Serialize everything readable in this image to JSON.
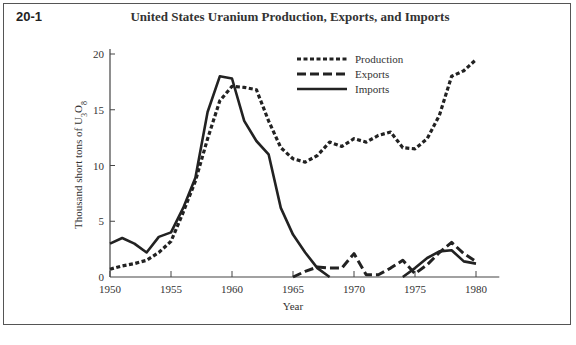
{
  "figure": {
    "number": "20-1",
    "title": "United States Uranium Production, Exports, and Imports"
  },
  "chart_data": {
    "type": "line",
    "title": "United States Uranium Production, Exports, and Imports",
    "xlabel": "Year",
    "ylabel": "Thousand short tons of U3O8",
    "xlim": [
      1950,
      1981.5
    ],
    "ylim": [
      0,
      20
    ],
    "x_ticks": [
      1950,
      1955,
      1960,
      1965,
      1970,
      1975,
      1980
    ],
    "y_ticks": [
      0,
      5,
      10,
      15,
      20
    ],
    "grid": false,
    "legend_position": "upper-right",
    "series": [
      {
        "name": "Production",
        "style": "dotted",
        "x": [
          1950,
          1951,
          1952,
          1953,
          1954,
          1955,
          1956,
          1957,
          1958,
          1959,
          1960,
          1961,
          1962,
          1963,
          1964,
          1965,
          1966,
          1967,
          1968,
          1969,
          1970,
          1971,
          1972,
          1973,
          1974,
          1975,
          1976,
          1977,
          1978,
          1979,
          1980
        ],
        "values": [
          0.7,
          1.0,
          1.2,
          1.5,
          2.2,
          3.2,
          5.8,
          8.6,
          12.4,
          15.8,
          17.1,
          17.0,
          16.8,
          14.0,
          11.6,
          10.6,
          10.3,
          10.9,
          12.1,
          11.7,
          12.4,
          12.1,
          12.7,
          13.0,
          11.6,
          11.5,
          12.4,
          14.5,
          18.0,
          18.5,
          19.5
        ]
      },
      {
        "name": "Exports",
        "style": "dashed",
        "x": [
          1965,
          1966,
          1967,
          1968,
          1969,
          1970,
          1971,
          1972,
          1973,
          1974,
          1975,
          1976,
          1977,
          1978,
          1979,
          1980
        ],
        "values": [
          0.0,
          0.5,
          0.9,
          0.8,
          0.8,
          2.1,
          0.2,
          0.2,
          0.8,
          1.5,
          0.3,
          1.1,
          2.2,
          3.1,
          2.1,
          1.4
        ]
      },
      {
        "name": "Imports",
        "style": "solid",
        "x": [
          1950,
          1951,
          1952,
          1953,
          1954,
          1955,
          1956,
          1957,
          1958,
          1959,
          1960,
          1961,
          1962,
          1963,
          1964,
          1965,
          1966,
          1967,
          1968,
          1974,
          1975,
          1976,
          1977,
          1978,
          1979,
          1980
        ],
        "values": [
          3.0,
          3.5,
          3.0,
          2.2,
          3.6,
          4.0,
          6.2,
          8.9,
          14.8,
          18.0,
          17.8,
          14.0,
          12.2,
          11.0,
          6.2,
          3.8,
          2.2,
          0.8,
          0.0,
          0.0,
          0.8,
          1.7,
          2.3,
          2.4,
          1.4,
          1.2
        ]
      }
    ]
  }
}
